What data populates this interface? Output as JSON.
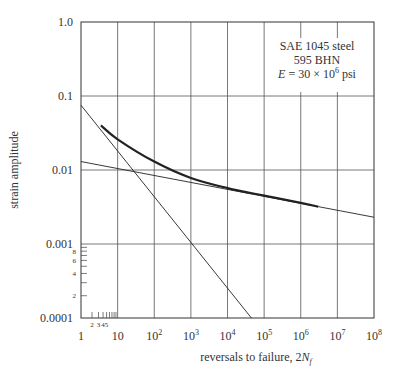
{
  "chart_data": {
    "type": "line",
    "title": "",
    "xlabel": "reversals to failure, 2N_f",
    "ylabel": "strain amplitude",
    "xscale": "log",
    "yscale": "log",
    "xlim": [
      1,
      100000000
    ],
    "ylim": [
      0.0001,
      1.0
    ],
    "grid": true,
    "x_tick_labels": [
      "1",
      "10",
      "10^2",
      "10^3",
      "10^4",
      "10^5",
      "10^6",
      "10^7",
      "10^8"
    ],
    "y_tick_labels": [
      "1.0",
      "0.1",
      "0.01",
      "0.001",
      "0.0001"
    ],
    "y_minor_tick_labels": [
      "2",
      "4",
      "6",
      "8"
    ],
    "x_minor_tick_labels": [
      "2",
      "3",
      "4",
      "5"
    ],
    "annotation": {
      "lines": [
        "SAE 1045 steel",
        "595 BHN",
        "E = 30 × 10^6 psi"
      ]
    },
    "series": [
      {
        "name": "total strain (thick curve)",
        "x": [
          3.5,
          10,
          100,
          1000,
          10000,
          100000,
          1000000,
          3000000
        ],
        "y": [
          0.04,
          0.026,
          0.013,
          0.0078,
          0.0057,
          0.0045,
          0.0036,
          0.0032
        ]
      },
      {
        "name": "plastic strain line",
        "x": [
          1,
          10,
          100,
          1000,
          10000,
          45000
        ],
        "y": [
          0.075,
          0.02,
          0.0055,
          0.0011,
          0.00028,
          0.0001
        ]
      },
      {
        "name": "elastic strain line",
        "x": [
          1,
          10,
          100,
          1000,
          10000,
          100000,
          1000000,
          10000000,
          100000000
        ],
        "y": [
          0.013,
          0.0105,
          0.0087,
          0.0071,
          0.0058,
          0.0047,
          0.0039,
          0.0031,
          0.0023
        ]
      }
    ]
  },
  "labels": {
    "xlabel_main": "reversals to failure, 2",
    "xlabel_var": "N",
    "xlabel_sub": "f",
    "ylabel": "strain amplitude",
    "note1": "SAE 1045 steel",
    "note2": "595 BHN",
    "note3_e": "E",
    "note3_rest": " = 30 × 10",
    "note3_exp": "6",
    "note3_unit": " psi"
  }
}
